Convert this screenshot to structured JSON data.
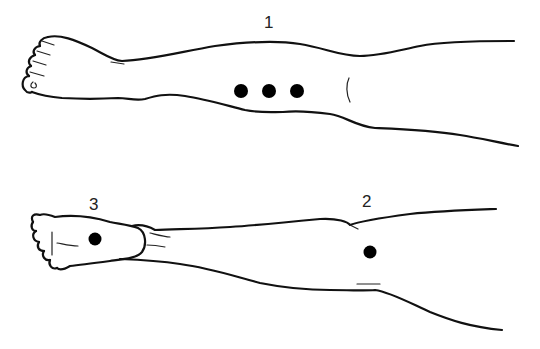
{
  "figure": {
    "views": [
      {
        "id": "view-1",
        "label": "1",
        "description": "Lateral view of leg with foot pointing left; three points marked in a row on the lower leg",
        "points": [
          {
            "x": 241,
            "y": 91
          },
          {
            "x": 269,
            "y": 91
          },
          {
            "x": 297,
            "y": 91
          }
        ]
      },
      {
        "id": "view-2",
        "label": "2",
        "description": "Posterior view of leg; one point marked on the back of the knee/calf region",
        "points": [
          {
            "x": 370,
            "y": 252
          }
        ]
      },
      {
        "id": "view-3",
        "label": "3",
        "description": "Sole of the foot; one point marked on the plantar surface",
        "points": [
          {
            "x": 95,
            "y": 239
          }
        ]
      }
    ],
    "colors": {
      "line": "#111111",
      "dot": "#000000",
      "background": "#ffffff"
    }
  }
}
